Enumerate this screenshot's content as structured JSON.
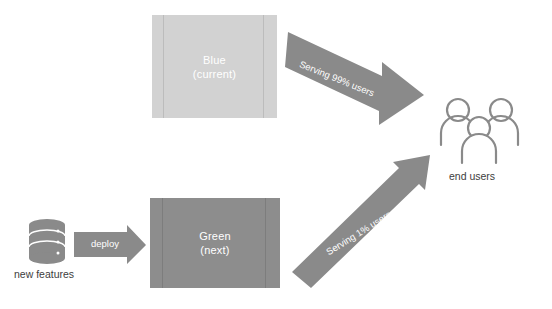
{
  "diagram": {
    "background": "#ffffff",
    "environments": [
      {
        "id": "blue",
        "name": "Blue",
        "state": "(current)",
        "color": "#d2d2d2",
        "text_color": "#ffffff"
      },
      {
        "id": "green",
        "name": "Green",
        "state": "(next)",
        "color": "#8d8d8d",
        "text_color": "#ffffff"
      }
    ],
    "source": {
      "icon": "database-icon",
      "label": "new features",
      "color": "#8a8a8a"
    },
    "deploy_arrow": {
      "label": "deploy",
      "color": "#8a8a8a",
      "text_color": "#ffffff"
    },
    "traffic_arrows": [
      {
        "id": "blue-traffic",
        "label": "Serving 99% users",
        "from": "Blue",
        "to": "end users",
        "color": "#8a8a8a",
        "text_color": "#ffffff"
      },
      {
        "id": "green-traffic",
        "label": "Serving 1% users",
        "from": "Green",
        "to": "end users",
        "color": "#8a8a8a",
        "text_color": "#ffffff"
      }
    ],
    "audience": {
      "icon": "users-group-icon",
      "label": "end users",
      "count": 3,
      "color": "#8a8a8a"
    }
  }
}
